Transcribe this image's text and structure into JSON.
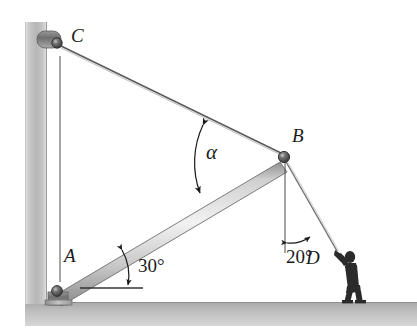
{
  "figure": {
    "background_color": "#ffffff",
    "ink_color": "#1a1a1a",
    "wall_color": "#b4b4b4",
    "ground_color": "#b0b0b0",
    "beam_color": "#d8d8d8",
    "labels": {
      "point_c": "C",
      "point_b": "B",
      "point_a": "A",
      "point_d": "D",
      "angle_alpha": "α",
      "angle_beam": "30°",
      "angle_rope": "20°"
    },
    "geometry": {
      "point_a": {
        "x": 57,
        "y": 289
      },
      "point_b": {
        "x": 284,
        "y": 155
      },
      "point_c": {
        "x": 59,
        "y": 44
      },
      "point_d": {
        "x": 338,
        "y": 252
      },
      "beam_angle_deg": 30,
      "rope_angle_deg": 20,
      "cable_angle_label": "α"
    },
    "elements": {
      "wall": "vertical-wall",
      "ground": "ground-surface",
      "beam": "beam-ab",
      "cable": "cable-bc",
      "rope": "rope-bd",
      "vertical_ref_c": "vertical-reference-line-from-c",
      "vertical_ref_b": "vertical-reference-line-from-b",
      "horizontal_ref_a": "horizontal-reference-line-at-a",
      "pin_a": "pin-support-a",
      "pin_c": "pin-support-c",
      "pin_b": "pin-joint-b",
      "worker": "worker-figure"
    }
  }
}
